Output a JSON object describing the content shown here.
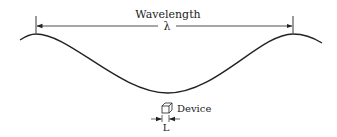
{
  "diagram": {
    "wavelength_label": "Wavelength",
    "wavelength_symbol": "λ",
    "device_label": "Device",
    "device_length_symbol": "L",
    "colors": {
      "line": "#222222",
      "background": "#ffffff"
    },
    "icons": {
      "device": "cube-icon"
    }
  }
}
